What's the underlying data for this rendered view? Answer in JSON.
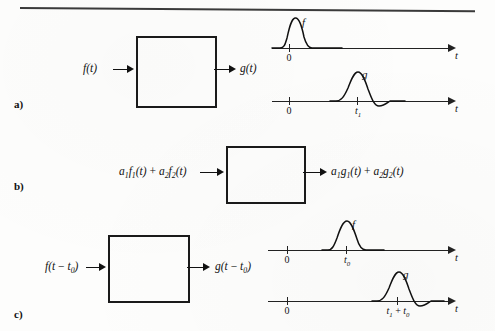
{
  "figure": {
    "type": "linear-time-invariant-system-properties",
    "top_rule": true
  },
  "panels": [
    {
      "letter": "a)",
      "name": "basic-system",
      "block": {
        "input_label": "f(t)",
        "output_label": "g(t)"
      },
      "plots": [
        {
          "signal": "f",
          "curve_label": "f",
          "axis_label": "t",
          "ticks": [
            {
              "label": "0"
            }
          ],
          "shape": "pulse"
        },
        {
          "signal": "g",
          "curve_label": "g",
          "axis_label": "t",
          "ticks": [
            {
              "label": "0"
            },
            {
              "label": "t1"
            }
          ],
          "shape": "pulse-with-undershoot"
        }
      ]
    },
    {
      "letter": "b)",
      "name": "superposition",
      "block": {
        "input_label": "a1f1(t) + a2f2(t)",
        "output_label": "a1g1(t) + a2g2(t)"
      },
      "plots": []
    },
    {
      "letter": "c)",
      "name": "time-invariance",
      "block": {
        "input_label": "f(t - t0)",
        "output_label": "g(t - t0)"
      },
      "plots": [
        {
          "signal": "f-shifted",
          "curve_label": "f",
          "axis_label": "t",
          "ticks": [
            {
              "label": "0"
            },
            {
              "label": "t0"
            }
          ],
          "shape": "pulse"
        },
        {
          "signal": "g-shifted",
          "curve_label": "g",
          "axis_label": "t",
          "ticks": [
            {
              "label": "0"
            },
            {
              "label": "t1 + t0"
            }
          ],
          "shape": "pulse-with-undershoot"
        }
      ]
    }
  ],
  "labels": {
    "a_letter": "a)",
    "b_letter": "b)",
    "c_letter": "c)",
    "f_of_t": "f(t)",
    "g_of_t": "g(t)",
    "f_curve": "f",
    "g_curve": "g",
    "axis_t": "t",
    "zero": "0",
    "t_one": "t",
    "t_one_sub": "1",
    "t_zero": "t",
    "t_zero_sub": "0",
    "a_sub1": "1",
    "a_sub2": "2"
  }
}
